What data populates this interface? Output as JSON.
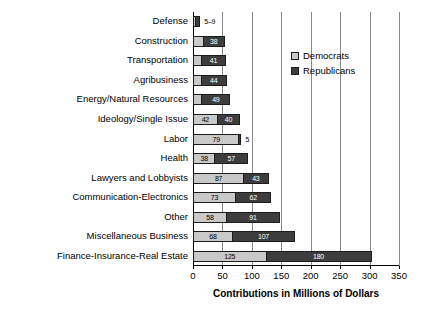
{
  "chart_data": {
    "type": "bar",
    "orientation": "horizontal",
    "stacked": true,
    "title": "",
    "xlabel": "Contributions in Millions of Dollars",
    "ylabel": "",
    "xlim": [
      0,
      350
    ],
    "xticks": [
      0,
      50,
      100,
      150,
      200,
      250,
      300,
      350
    ],
    "grid": "vertical",
    "legend_position": "upper right",
    "categories": [
      "Defense",
      "Construction",
      "Transportation",
      "Agribusiness",
      "Energy/Natural Resources",
      "Ideology/Single Issue",
      "Labor",
      "Health",
      "Lawyers and Lobbyists",
      "Communication-Electronics",
      "Other",
      "Miscellaneous Business",
      "Finance-Insurance-Real Estate"
    ],
    "series": [
      {
        "name": "Democrats",
        "color": "#c9c9c9",
        "values": [
          5,
          18,
          16,
          15,
          16,
          42,
          79,
          38,
          87,
          73,
          58,
          68,
          125
        ]
      },
      {
        "name": "Republicans",
        "color": "#3d3d3d",
        "values": [
          9,
          38,
          41,
          44,
          49,
          40,
          5,
          57,
          43,
          62,
          91,
          107,
          180
        ]
      }
    ],
    "bar_labels": [
      {
        "category": "Defense",
        "dem": "5",
        "rep": "9",
        "combined": "5–9",
        "placement": "outside"
      },
      {
        "category": "Construction",
        "dem": "18",
        "rep": "38",
        "placement": "inside"
      },
      {
        "category": "Transportation",
        "dem": "16",
        "rep": "41",
        "placement": "inside"
      },
      {
        "category": "Agribusiness",
        "dem": "15",
        "rep": "44",
        "placement": "inside"
      },
      {
        "category": "Energy/Natural Resources",
        "dem": "16",
        "rep": "49",
        "placement": "inside"
      },
      {
        "category": "Ideology/Single Issue",
        "dem": "42",
        "rep": "40",
        "placement": "inside"
      },
      {
        "category": "Labor",
        "dem": "79",
        "rep": "5",
        "placement": "mixed"
      },
      {
        "category": "Health",
        "dem": "38",
        "rep": "57",
        "placement": "inside"
      },
      {
        "category": "Lawyers and Lobbyists",
        "dem": "87",
        "rep": "43",
        "placement": "inside"
      },
      {
        "category": "Communication-Electronics",
        "dem": "73",
        "rep": "62",
        "placement": "inside"
      },
      {
        "category": "Other",
        "dem": "58",
        "rep": "91",
        "placement": "inside"
      },
      {
        "category": "Miscellaneous Business",
        "dem": "68",
        "rep": "107",
        "placement": "inside"
      },
      {
        "category": "Finance-Insurance-Real Estate",
        "dem": "125",
        "rep": "180",
        "placement": "inside"
      }
    ]
  },
  "legend": {
    "items": [
      {
        "label": "Democrats",
        "swatch": "dem"
      },
      {
        "label": "Republicans",
        "swatch": "rep"
      }
    ]
  },
  "axis": {
    "x_title": "Contributions in Millions of Dollars",
    "tick_labels": [
      "0",
      "50",
      "100",
      "150",
      "200",
      "250",
      "300",
      "350"
    ]
  },
  "colors": {
    "democrats": "#c9c9c9",
    "republicans": "#3d3d3d",
    "gridline": "#8a8a8a",
    "axis": "#000000",
    "background": "#ffffff"
  }
}
